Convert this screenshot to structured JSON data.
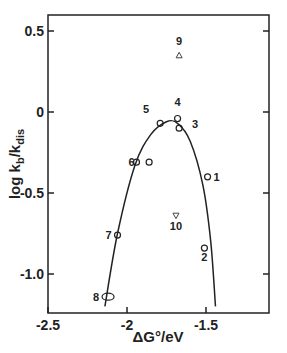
{
  "chart_data": {
    "type": "scatter",
    "title": "",
    "xlabel": "ΔG°/eV",
    "ylabel": "log kb/kdis",
    "xlim": [
      -2.5,
      -1.1
    ],
    "ylim": [
      -1.2,
      0.6
    ],
    "xticks": [
      -2.5,
      -2,
      -1.5
    ],
    "xtick_labels": [
      "-2.5",
      "-2",
      "-1.5"
    ],
    "yticks": [
      0.5,
      0,
      -0.5,
      -1.0
    ],
    "ytick_labels": [
      "0.5",
      "0",
      "-0.5",
      "-1.0"
    ],
    "grid": false,
    "legend": null,
    "series": [
      {
        "name": "circles",
        "marker": "circle",
        "points": [
          {
            "label": "1",
            "x": -1.49,
            "y": -0.4
          },
          {
            "label": "2",
            "x": -1.51,
            "y": -0.84
          },
          {
            "label": "3",
            "x": -1.67,
            "y": -0.1
          },
          {
            "label": "4",
            "x": -1.68,
            "y": -0.04
          },
          {
            "label": "5",
            "x": -1.79,
            "y": -0.07
          },
          {
            "label": "6",
            "x": -1.94,
            "y": -0.31
          },
          {
            "label": "",
            "x": -1.86,
            "y": -0.31
          },
          {
            "label": "7",
            "x": -2.06,
            "y": -0.76
          },
          {
            "label": "8",
            "x": -2.12,
            "y": -1.14
          }
        ]
      },
      {
        "name": "triangle-up",
        "marker": "triangle-up",
        "points": [
          {
            "label": "9",
            "x": -1.67,
            "y": 0.35
          }
        ]
      },
      {
        "name": "triangle-down",
        "marker": "triangle-down",
        "points": [
          {
            "label": "10",
            "x": -1.69,
            "y": -0.64
          }
        ]
      },
      {
        "name": "fit",
        "type": "line",
        "points": [
          {
            "x": -2.14,
            "y": -1.2
          },
          {
            "x": -2.06,
            "y": -0.75
          },
          {
            "x": -1.95,
            "y": -0.33
          },
          {
            "x": -1.85,
            "y": -0.14
          },
          {
            "x": -1.75,
            "y": -0.06
          },
          {
            "x": -1.68,
            "y": -0.07
          },
          {
            "x": -1.6,
            "y": -0.18
          },
          {
            "x": -1.52,
            "y": -0.45
          },
          {
            "x": -1.47,
            "y": -0.8
          },
          {
            "x": -1.44,
            "y": -1.2
          }
        ]
      }
    ]
  }
}
